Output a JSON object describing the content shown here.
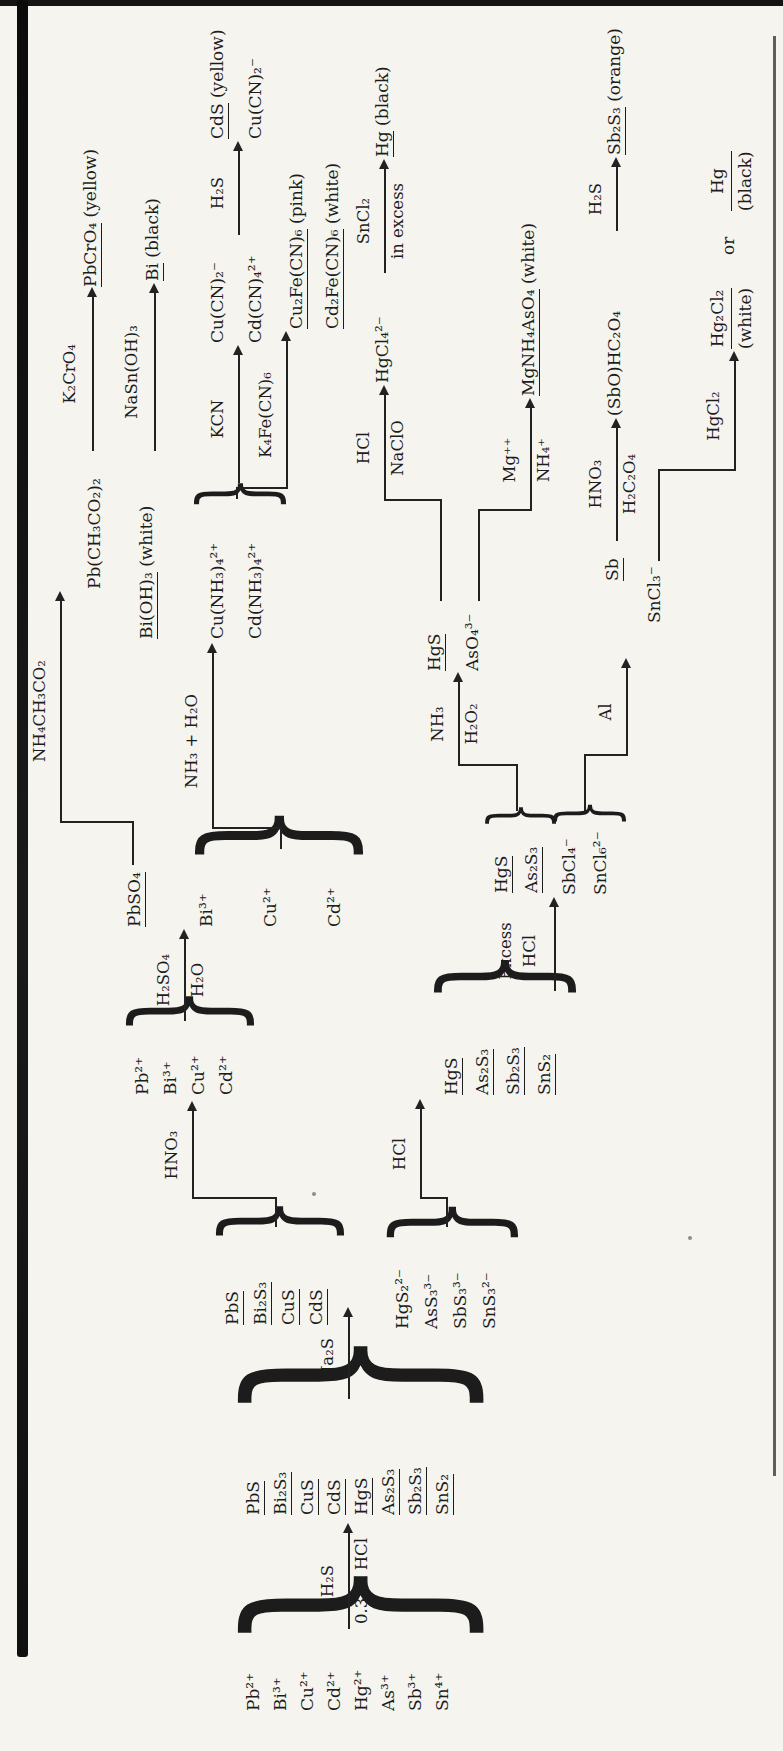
{
  "glyphs": {
    "brace": "}"
  },
  "scheme": {
    "start": [
      "Pb²⁺",
      "Bi³⁺",
      "Cu²⁺",
      "Cd²⁺",
      "Hg²⁺",
      "As³⁺",
      "Sb³⁺",
      "Sn⁴⁺"
    ],
    "sulfides": [
      "PbS",
      "Bi₂S₃",
      "CuS",
      "CdS",
      "HgS",
      "As₂S₃",
      "Sb₂S₃",
      "SnS₂"
    ],
    "copper_ppt": [
      "PbS",
      "Bi₂S₃",
      "CuS",
      "CdS"
    ],
    "thio_ions": [
      "HgS₂²⁻",
      "AsS₃³⁻",
      "SbS₃³⁻",
      "SnS₃²⁻"
    ],
    "copper_ions": [
      "Pb²⁺",
      "Bi³⁺",
      "Cu²⁺",
      "Cd²⁺"
    ],
    "pbso4": "PbSO₄",
    "bi_ion": "Bi³⁺",
    "cu_ion": "Cu²⁺",
    "cd_ion": "Cd²⁺",
    "pb_acetate": "Pb(CH₃CO₂)₂",
    "pbcro4": "PbCrO₄",
    "pbcro4_note": "(yellow)",
    "bioh3": "Bi(OH)₃",
    "bioh3_note": "(white)",
    "bi_metal": "Bi",
    "bi_metal_note": "(black)",
    "ammine": [
      "Cu(NH₃)₄²⁺",
      "Cd(NH₃)₄²⁺"
    ],
    "cyanide": [
      "Cu(CN)₂⁻",
      "Cd(CN)₄²⁺"
    ],
    "cds": "CdS",
    "cds_note": "(yellow)",
    "cucn": "Cu(CN)₂⁻",
    "ferro": [
      "Cu₂Fe(CN)₆",
      "Cd₂Fe(CN)₆"
    ],
    "ferro_notes": [
      "(pink)",
      "(white)"
    ],
    "sulfides2": [
      "HgS",
      "As₂S₃",
      "Sb₂S₃",
      "SnS₂"
    ],
    "hgs_as2s3": [
      "HgS",
      "As₂S₃"
    ],
    "chloro": [
      "SbCl₄⁻",
      "SnCl₆²⁻"
    ],
    "hgs": "HgS",
    "aso4": "AsO₄³⁻",
    "hgcl4": "HgCl₄²⁻",
    "hg1": "Hg",
    "hg1_note": "(black)",
    "mgsalt": "MgNH₄AsO₄",
    "mgsalt_note": "(white)",
    "sb": "Sb",
    "sncl3": "SnCl₃⁻",
    "sbo": "(SbO)HC₂O₄",
    "sb2s3": "Sb₂S₃",
    "sb2s3_note": "(orange)",
    "hg2cl2": "Hg₂Cl₂",
    "hg2cl2_note": "(white)",
    "or": "or",
    "hg2": "Hg",
    "hg2_note": "(black)",
    "arrows": {
      "h2s": {
        "above": "H₂S",
        "below": "0.3 M HCl"
      },
      "na2s": {
        "above": "Na₂S"
      },
      "hno3": {
        "above": "HNO₃"
      },
      "h2so4": {
        "above": "H₂SO₄",
        "below": "H₂O"
      },
      "nh4ac": {
        "above": "NH₄CH₃CO₂"
      },
      "k2cro4": {
        "above": "K₂CrO₄"
      },
      "nh3": {
        "above": "NH₃ + H₂O"
      },
      "stannite": {
        "above": "NaSn(OH)₃"
      },
      "kcn": {
        "above": "KCN"
      },
      "h2s_b": {
        "above": "H₂S"
      },
      "ferro": {
        "above": "K₄Fe(CN)₆"
      },
      "hcl": {
        "above": "HCl"
      },
      "excess": {
        "line1": "Excess",
        "line2": "HCl"
      },
      "nh3h2o2": {
        "above": "NH₃",
        "below": "H₂O₂"
      },
      "hclnaclo": {
        "above": "HCl",
        "below": "NaClO"
      },
      "sncl2": {
        "above": "SnCl₂",
        "below": "in excess"
      },
      "mg": {
        "above": "Mg⁺⁺",
        "below": "NH₄⁺"
      },
      "al": {
        "above": "Al"
      },
      "hno3ox": {
        "above": "HNO₃",
        "below": "H₂C₂O₄"
      },
      "h2s_c": {
        "above": "H₂S"
      },
      "hgcl2": {
        "above": "HgCl₂"
      }
    }
  }
}
